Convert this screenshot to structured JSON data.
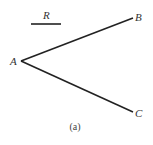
{
  "diagram": {
    "caption": "(a)",
    "segment_label": "R",
    "points": {
      "A": {
        "label": "A"
      },
      "B": {
        "label": "B"
      },
      "C": {
        "label": "C"
      }
    },
    "rays": [
      {
        "from": "A",
        "to": "B"
      },
      {
        "from": "A",
        "to": "C"
      }
    ],
    "colors": {
      "line": "#222222",
      "text": "#333333",
      "background": "#ffffff"
    }
  }
}
